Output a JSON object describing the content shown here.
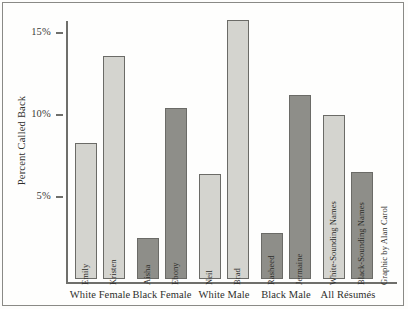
{
  "chart_data": {
    "type": "bar",
    "title": "",
    "subtitle": "",
    "xlabel": "",
    "ylabel": "Percent Called Back",
    "ylim": [
      0,
      16.8
    ],
    "yticks": [
      5,
      10,
      15
    ],
    "ytick_labels": [
      "5%",
      "10%",
      "15%"
    ],
    "grid": false,
    "legend_position": "none",
    "categories": [
      "Emily",
      "Kristen",
      "Aisha",
      "Ebony",
      "Neil",
      "Brad",
      "Rasheed",
      "Jermaine",
      "White-Sounding Names",
      "Black-Sounding Names"
    ],
    "values": [
      8.3,
      13.6,
      2.5,
      10.4,
      6.4,
      15.8,
      2.8,
      11.2,
      10.0,
      6.5
    ],
    "bar_types": [
      "white-sounding",
      "white-sounding",
      "black-sounding",
      "black-sounding",
      "white-sounding",
      "white-sounding",
      "black-sounding",
      "black-sounding",
      "white-sounding",
      "black-sounding"
    ],
    "groups": [
      "White Female",
      "Black Female",
      "White Male",
      "Black Male",
      "All Résumés"
    ],
    "annotations": [
      "Graphic by Alan Carol"
    ]
  },
  "axis": {
    "y_title": "Percent Called Back",
    "ticks": [
      {
        "label": "15%",
        "value": 15
      },
      {
        "label": "10%",
        "value": 10
      },
      {
        "label": "5%",
        "value": 5
      }
    ]
  },
  "bars": [
    {
      "name": "Emily",
      "value": 8.3,
      "label": "Emily",
      "shade": "light"
    },
    {
      "name": "Kristen",
      "value": 13.6,
      "label": "Kristen",
      "shade": "light"
    },
    {
      "name": "Aisha",
      "value": 2.5,
      "label": "Aisha",
      "shade": "dark"
    },
    {
      "name": "Ebony",
      "value": 10.4,
      "label": "Ebony",
      "shade": "dark"
    },
    {
      "name": "Neil",
      "value": 6.4,
      "label": "Neil",
      "shade": "light"
    },
    {
      "name": "Brad",
      "value": 15.8,
      "label": "Brad",
      "shade": "light"
    },
    {
      "name": "Rasheed",
      "value": 2.8,
      "label": "Rasheed",
      "shade": "dark"
    },
    {
      "name": "Jermaine",
      "value": 11.2,
      "label": "Jermaine",
      "shade": "dark"
    },
    {
      "name": "White-Sounding Names",
      "value": 10.0,
      "label": "White-Sounding Names",
      "shade": "light"
    },
    {
      "name": "Black-Sounding Names",
      "value": 6.5,
      "label": "Black-Sounding Names",
      "shade": "dark"
    }
  ],
  "groups": [
    {
      "label": "White Female"
    },
    {
      "label": "Black Female"
    },
    {
      "label": "White Male"
    },
    {
      "label": "Black Male"
    },
    {
      "label": "All Résumés"
    }
  ],
  "credit": {
    "text": "Graphic by Alan Carol"
  },
  "colors": {
    "light_bar": "#d4d4cf",
    "dark_bar": "#8e8e89",
    "bar_stroke": "#6b6b67",
    "axis": "#6f6f6b",
    "text": "#2e2e2c",
    "background": "#fefefd",
    "frame": "#8a8a86"
  }
}
